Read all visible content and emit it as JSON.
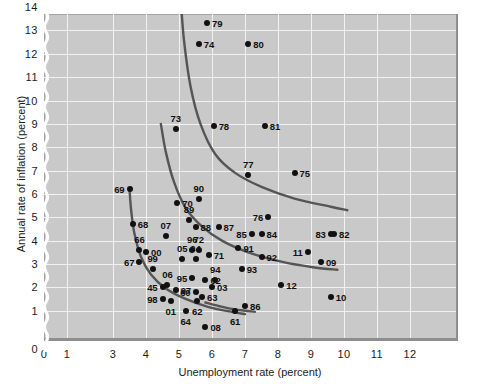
{
  "chart_data": {
    "type": "scatter",
    "title": "",
    "xlabel": "Unemployment rate (percent)",
    "ylabel": "Annual rate of inflation (percent)",
    "xlim": [
      0,
      12.6
    ],
    "ylim": [
      0,
      14.6
    ],
    "x_ticks": [
      "0",
      "1",
      "3",
      "4",
      "5",
      "6",
      "7",
      "8",
      "9",
      "10",
      "11",
      "12"
    ],
    "x_tick_values": [
      0,
      1,
      3,
      4,
      5,
      6,
      7,
      8,
      9,
      10,
      11,
      12
    ],
    "y_ticks": [
      "0",
      "1",
      "2",
      "3",
      "4",
      "5",
      "6",
      "7",
      "8",
      "9",
      "10",
      "11",
      "12",
      "13",
      "14"
    ],
    "y_tick_values": [
      0,
      1,
      2,
      3,
      4,
      5,
      6,
      7,
      8,
      9,
      10,
      11,
      12,
      13,
      14
    ],
    "axis_break_at_x": 2,
    "grid": true,
    "legend": "none",
    "plot_background": "#c9c9c9",
    "grid_color": "#f2f2f2",
    "point_color": "#111111",
    "curve_color": "#555555",
    "points": [
      {
        "label": "79",
        "x": 5.85,
        "y": 13.3,
        "lab": "r"
      },
      {
        "label": "74",
        "x": 5.6,
        "y": 12.4,
        "lab": "r"
      },
      {
        "label": "80",
        "x": 7.1,
        "y": 12.4,
        "lab": "r"
      },
      {
        "label": "73",
        "x": 4.9,
        "y": 8.8,
        "lab": "t"
      },
      {
        "label": "78",
        "x": 6.05,
        "y": 8.9,
        "lab": "r"
      },
      {
        "label": "81",
        "x": 7.6,
        "y": 8.9,
        "lab": "r"
      },
      {
        "label": "77",
        "x": 7.1,
        "y": 6.8,
        "lab": "t"
      },
      {
        "label": "75",
        "x": 8.5,
        "y": 6.9,
        "lab": "r"
      },
      {
        "label": "69",
        "x": 3.5,
        "y": 6.2,
        "lab": "l"
      },
      {
        "label": "90",
        "x": 5.6,
        "y": 5.8,
        "lab": "t"
      },
      {
        "label": "70",
        "x": 4.95,
        "y": 5.6,
        "lab": "r"
      },
      {
        "label": "68",
        "x": 3.6,
        "y": 4.7,
        "lab": "r"
      },
      {
        "label": "89",
        "x": 5.3,
        "y": 4.9,
        "lab": "t"
      },
      {
        "label": "88",
        "x": 5.5,
        "y": 4.6,
        "lab": "r"
      },
      {
        "label": "87",
        "x": 6.2,
        "y": 4.6,
        "lab": "r"
      },
      {
        "label": "76",
        "x": 7.7,
        "y": 5.0,
        "lab": "l"
      },
      {
        "label": "07",
        "x": 4.6,
        "y": 4.2,
        "lab": "t"
      },
      {
        "label": "66",
        "x": 3.8,
        "y": 3.6,
        "lab": "t"
      },
      {
        "label": "00",
        "x": 4.0,
        "y": 3.5,
        "lab": "r"
      },
      {
        "label": "96",
        "x": 5.4,
        "y": 3.6,
        "lab": "t"
      },
      {
        "label": "72",
        "x": 5.6,
        "y": 3.6,
        "lab": "t"
      },
      {
        "label": "71",
        "x": 5.9,
        "y": 3.4,
        "lab": "r"
      },
      {
        "label": "85",
        "x": 7.2,
        "y": 4.3,
        "lab": "l"
      },
      {
        "label": "84",
        "x": 7.5,
        "y": 4.3,
        "lab": "r"
      },
      {
        "label": "83",
        "x": 9.6,
        "y": 4.3,
        "lab": "l"
      },
      {
        "label": "82",
        "x": 9.7,
        "y": 4.3,
        "lab": "r"
      },
      {
        "label": "67",
        "x": 3.8,
        "y": 3.1,
        "lab": "l"
      },
      {
        "label": "99",
        "x": 4.2,
        "y": 2.8,
        "lab": "t"
      },
      {
        "label": "05",
        "x": 5.1,
        "y": 3.2,
        "lab": "t"
      },
      {
        "label": "04",
        "x": 5.5,
        "y": 3.2,
        "lab": "t"
      },
      {
        "label": "91",
        "x": 6.8,
        "y": 3.7,
        "lab": "r"
      },
      {
        "label": "92",
        "x": 7.5,
        "y": 3.3,
        "lab": "r"
      },
      {
        "label": "11",
        "x": 8.9,
        "y": 3.5,
        "lab": "l"
      },
      {
        "label": "09",
        "x": 9.3,
        "y": 3.1,
        "lab": "r"
      },
      {
        "label": "95",
        "x": 5.4,
        "y": 2.4,
        "lab": "l"
      },
      {
        "label": "02",
        "x": 5.8,
        "y": 2.3,
        "lab": "r"
      },
      {
        "label": "94",
        "x": 6.1,
        "y": 2.3,
        "lab": "t"
      },
      {
        "label": "03",
        "x": 6.0,
        "y": 2.0,
        "lab": "r"
      },
      {
        "label": "93",
        "x": 6.9,
        "y": 2.8,
        "lab": "r"
      },
      {
        "label": "45",
        "x": 4.5,
        "y": 2.0,
        "lab": "l"
      },
      {
        "label": "06",
        "x": 4.65,
        "y": 2.1,
        "lab": "t"
      },
      {
        "label": "97",
        "x": 4.9,
        "y": 1.9,
        "lab": "r"
      },
      {
        "label": "60",
        "x": 5.5,
        "y": 1.8,
        "lab": "l"
      },
      {
        "label": "63",
        "x": 5.7,
        "y": 1.6,
        "lab": "r"
      },
      {
        "label": "62",
        "x": 5.55,
        "y": 1.4,
        "lab": "b"
      },
      {
        "label": "98",
        "x": 4.5,
        "y": 1.5,
        "lab": "l"
      },
      {
        "label": "01",
        "x": 4.75,
        "y": 1.4,
        "lab": "b"
      },
      {
        "label": "12",
        "x": 8.1,
        "y": 2.1,
        "lab": "r"
      },
      {
        "label": "10",
        "x": 9.6,
        "y": 1.6,
        "lab": "r"
      },
      {
        "label": "86",
        "x": 7.0,
        "y": 1.2,
        "lab": "r"
      },
      {
        "label": "64",
        "x": 5.2,
        "y": 1.0,
        "lab": "b"
      },
      {
        "label": "08",
        "x": 5.8,
        "y": 0.3,
        "lab": "r"
      },
      {
        "label": "61",
        "x": 6.7,
        "y": 1.0,
        "lab": "b"
      }
    ],
    "curves": [
      {
        "name": "phillips-curve-1970s",
        "points": [
          [
            5.05,
            14.4
          ],
          [
            5.15,
            12.6
          ],
          [
            5.35,
            10.6
          ],
          [
            5.65,
            9.0
          ],
          [
            6.1,
            7.7
          ],
          [
            6.7,
            6.9
          ],
          [
            7.5,
            6.3
          ],
          [
            8.5,
            5.8
          ],
          [
            9.6,
            5.45
          ],
          [
            10.1,
            5.3
          ]
        ]
      },
      {
        "name": "phillips-curve-1960s-80s",
        "points": [
          [
            4.45,
            9.0
          ],
          [
            4.6,
            7.8
          ],
          [
            4.85,
            6.5
          ],
          [
            5.2,
            5.4
          ],
          [
            5.7,
            4.6
          ],
          [
            6.3,
            4.0
          ],
          [
            7.1,
            3.5
          ],
          [
            8.1,
            3.1
          ],
          [
            9.1,
            2.85
          ],
          [
            9.8,
            2.75
          ]
        ]
      },
      {
        "name": "phillips-curve-1960s",
        "points": [
          [
            3.5,
            6.2
          ],
          [
            3.55,
            5.3
          ],
          [
            3.65,
            4.3
          ],
          [
            3.85,
            3.3
          ],
          [
            4.15,
            2.55
          ],
          [
            4.6,
            1.95
          ],
          [
            5.2,
            1.5
          ],
          [
            5.9,
            1.15
          ],
          [
            6.6,
            0.95
          ],
          [
            7.0,
            0.85
          ]
        ]
      },
      {
        "name": "phillips-curve-flat-segment",
        "points": [
          [
            5.8,
            1.35
          ],
          [
            6.2,
            1.2
          ],
          [
            6.7,
            1.05
          ],
          [
            7.3,
            0.95
          ]
        ]
      }
    ]
  }
}
